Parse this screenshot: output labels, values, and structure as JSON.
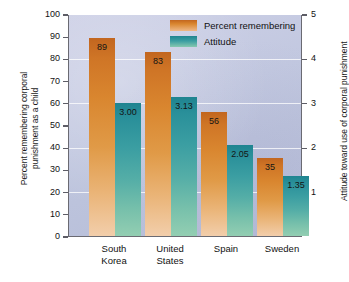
{
  "chart_data": {
    "type": "bar",
    "title": "",
    "subtitle": "",
    "categories": [
      "South Korea",
      "United States",
      "Spain",
      "Sweden"
    ],
    "category_lines": [
      [
        "South",
        "Korea"
      ],
      [
        "United",
        "States"
      ],
      [
        "Spain",
        ""
      ],
      [
        "Sweden",
        ""
      ]
    ],
    "series": [
      {
        "name": "Percent remembering",
        "axis": "left",
        "color": "#d9862f",
        "values": [
          89,
          83,
          56,
          35
        ],
        "value_labels": [
          "89",
          "83",
          "56",
          "35"
        ]
      },
      {
        "name": "Attitude",
        "axis": "right",
        "color": "#3b9ea2",
        "values": [
          3.0,
          3.13,
          2.05,
          1.35
        ],
        "value_labels": [
          "3.00",
          "3.13",
          "2.05",
          "1.35"
        ]
      }
    ],
    "xlabel": "",
    "ylabel": "Percent remembering corporal punishment as a child",
    "ylabel_right": "Attitude toward use of corporal punishment",
    "ylim": [
      0,
      100
    ],
    "ylim_right": [
      0,
      5
    ],
    "yticks": [
      0,
      10,
      20,
      30,
      40,
      50,
      60,
      70,
      80,
      90,
      100
    ],
    "ytick_labels": [
      "0",
      "10",
      "20",
      "30",
      "40",
      "50",
      "60",
      "70",
      "80",
      "90",
      "100"
    ],
    "yticks_right": [
      1,
      2,
      3,
      4,
      5
    ],
    "ytick_labels_right": [
      "1",
      "2",
      "3",
      "4",
      "5"
    ],
    "grid": true,
    "gridline_values": [
      20,
      40,
      60,
      80
    ],
    "legend_position": "top-right",
    "legend": [
      "Percent remembering",
      "Attitude"
    ]
  },
  "axes": {
    "left_title_line1": "Percent remembering corporal",
    "left_title_line2": "punishment as a child",
    "right_title": "Attitude toward use of corporal punishment"
  },
  "legend": {
    "items": [
      {
        "label": "Percent remembering",
        "swatch": "percent-swatch"
      },
      {
        "label": "Attitude",
        "swatch": "attitude-swatch"
      }
    ]
  },
  "ticks": {
    "left": [
      "100",
      "90",
      "80",
      "70",
      "60",
      "50",
      "40",
      "30",
      "20",
      "10",
      "0"
    ],
    "right": [
      "5",
      "4",
      "3",
      "2",
      "1"
    ]
  },
  "bars": [
    {
      "category_l1": "South",
      "category_l2": "Korea",
      "percent": "89",
      "attitude": "3.00"
    },
    {
      "category_l1": "United",
      "category_l2": "States",
      "percent": "83",
      "attitude": "3.13"
    },
    {
      "category_l1": "Spain",
      "category_l2": "",
      "percent": "56",
      "attitude": "2.05"
    },
    {
      "category_l1": "Sweden",
      "category_l2": "",
      "percent": "35",
      "attitude": "1.35"
    }
  ],
  "colors": {
    "percent_bar": "#d9862f",
    "attitude_bar": "#3b9ea2",
    "plot_background": "#c2c8e0",
    "gridline": "#ffffff",
    "axis": "#6a6a72"
  }
}
